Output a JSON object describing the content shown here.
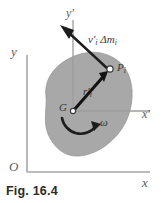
{
  "figure": {
    "caption": "Fig. 16.4",
    "kind": "rigid-body-dynamics-diagram"
  },
  "axes": {
    "fixed": {
      "y_label": "y",
      "x_label": "x",
      "origin_label": "O",
      "color": "#9a9a9a"
    },
    "centroidal": {
      "y_label": "y",
      "y_prime_mark": "′",
      "x_label": "x",
      "x_prime_mark": "′",
      "color": "#9a9a9a"
    }
  },
  "body": {
    "name": "rigid-body-blob",
    "fill": "#a8a8a8",
    "stroke": "#8f8f8f"
  },
  "points": {
    "center_of_mass": {
      "label": "G",
      "marker": "open-circle"
    },
    "particle": {
      "label": "P",
      "subscript": "i",
      "marker": "open-circle"
    }
  },
  "vectors": {
    "position": {
      "symbol": "r",
      "prime": "′",
      "subscript": "i",
      "description": "position vector from G to particle Pi",
      "color": "#1d1d1d"
    },
    "momentum": {
      "symbol": "v",
      "prime": "′",
      "subscript": "i",
      "delta": "Δm",
      "delta_subscript": "i",
      "description": "linear momentum of particle",
      "color": "#1d1d1d"
    }
  },
  "rotation": {
    "label": "ω",
    "description": "angular velocity, counterclockwise curved arrow",
    "color": "#1d1d1d"
  }
}
